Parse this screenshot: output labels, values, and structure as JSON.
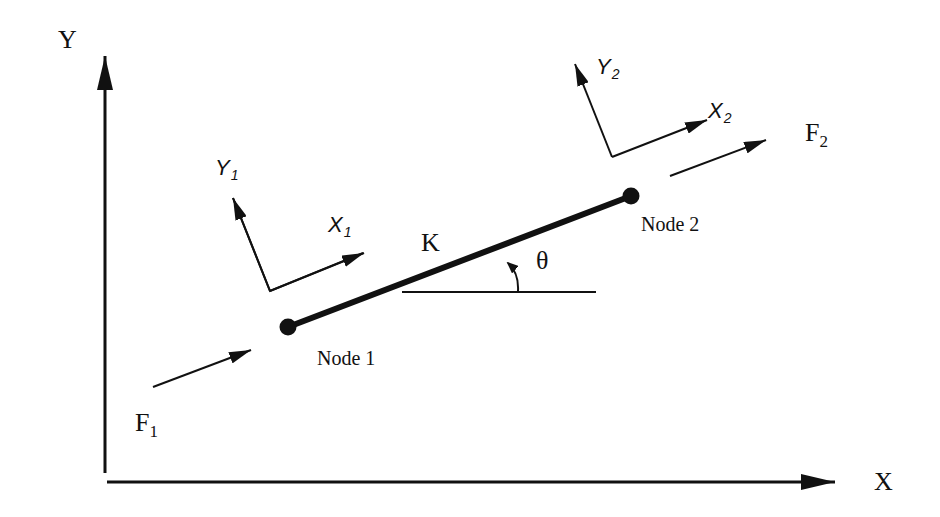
{
  "diagram": {
    "type": "spring-element-2d",
    "global_axes": {
      "x_label": "X",
      "y_label": "Y"
    },
    "element": {
      "label": "K",
      "angle_label": "θ"
    },
    "nodes": [
      {
        "label": "Node 1",
        "local_x": "X",
        "local_x_sub": "1",
        "local_y": "Y",
        "local_y_sub": "1",
        "force": "F",
        "force_sub": "1"
      },
      {
        "label": "Node 2",
        "local_x": "X",
        "local_x_sub": "2",
        "local_y": "Y",
        "local_y_sub": "2",
        "force": "F",
        "force_sub": "2"
      }
    ]
  },
  "colors": {
    "ink": "#111111",
    "background": "#ffffff"
  }
}
